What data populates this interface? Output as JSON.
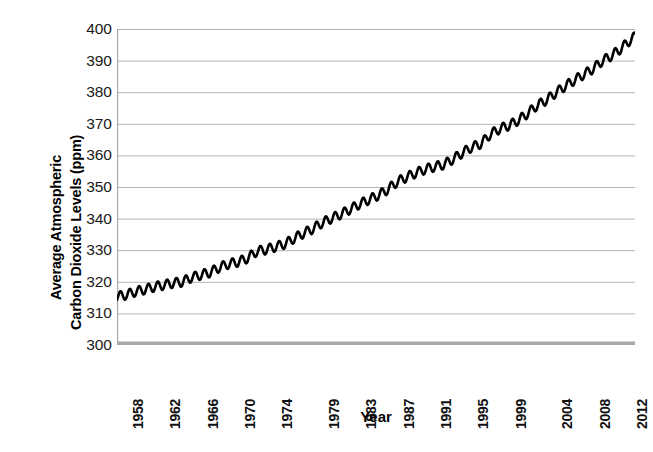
{
  "figure": {
    "background": "#ffffff",
    "line_color": "#000000",
    "gridline_color": "#b3b3b3",
    "axis_color": "#a6a6a6",
    "baseline_color": "#a8a8a8"
  },
  "chart_data": {
    "type": "line",
    "title": "",
    "subtitle": "",
    "xlabel": "Year",
    "ylabel": "Average Atmospheric Carbon Dioxide Levels (ppm)",
    "ylabel_lines": [
      "Average Atmospheric",
      "Carbon Dioxide Levels (ppm)"
    ],
    "ylim": [
      300,
      400
    ],
    "yticks": [
      400,
      390,
      380,
      370,
      360,
      350,
      340,
      330,
      320,
      310,
      300
    ],
    "ytick_labels": [
      "400",
      "390",
      "380",
      "370",
      "360",
      "350",
      "340",
      "330",
      "320",
      "310",
      "300"
    ],
    "xlim": [
      1958,
      2013.5
    ],
    "xticks": [
      1958,
      1962,
      1966,
      1970,
      1974,
      1979,
      1983,
      1987,
      1991,
      1995,
      1999,
      2004,
      2008,
      2012
    ],
    "xtick_labels": [
      "1958",
      "1962",
      "1966",
      "1970",
      "1974",
      "1979",
      "1983",
      "1987",
      "1991",
      "1995",
      "1999",
      "2004",
      "2008",
      "2012"
    ],
    "grid": true,
    "grid_axis": "y",
    "legend": false,
    "legend_position": "none",
    "annotations": [],
    "series": [
      {
        "name": "Monthly mean CO2 (Mauna Loa)",
        "description": "Annual mean trend with seasonal sawtooth oscillation of about 3 ppm peak-to-peak; seasonal maximum in May, minimum in September/October.",
        "seasonal_amplitude_ppm": 3.0,
        "x": [
          1958,
          1959,
          1960,
          1961,
          1962,
          1963,
          1964,
          1965,
          1966,
          1967,
          1968,
          1969,
          1970,
          1971,
          1972,
          1973,
          1974,
          1975,
          1976,
          1977,
          1978,
          1979,
          1980,
          1981,
          1982,
          1983,
          1984,
          1985,
          1986,
          1987,
          1988,
          1989,
          1990,
          1991,
          1992,
          1993,
          1994,
          1995,
          1996,
          1997,
          1998,
          1999,
          2000,
          2001,
          2002,
          2003,
          2004,
          2005,
          2006,
          2007,
          2008,
          2009,
          2010,
          2011,
          2012,
          2013
        ],
        "annual_mean": [
          315.3,
          315.9,
          316.9,
          317.6,
          318.4,
          319.0,
          319.6,
          320.0,
          321.4,
          322.2,
          323.0,
          324.6,
          325.7,
          326.3,
          327.5,
          329.7,
          330.2,
          331.1,
          332.0,
          333.8,
          335.4,
          336.8,
          338.7,
          340.1,
          341.4,
          343.0,
          344.6,
          346.0,
          347.4,
          349.2,
          351.6,
          353.1,
          354.4,
          355.6,
          356.4,
          357.1,
          358.8,
          360.8,
          362.6,
          363.7,
          366.7,
          368.4,
          369.5,
          371.1,
          373.3,
          375.8,
          377.5,
          379.8,
          381.9,
          383.8,
          385.6,
          387.4,
          389.9,
          391.6,
          393.8,
          396.5
        ]
      }
    ]
  },
  "xaxis": {
    "label": "Year"
  }
}
